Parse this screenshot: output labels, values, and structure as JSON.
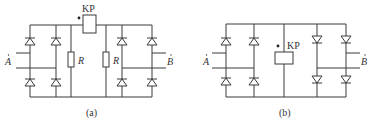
{
  "figures": [
    {
      "id": "a",
      "caption": "(a)",
      "relay_label": "KP",
      "resistor_labels": [
        "R",
        "R"
      ],
      "input_label": "A",
      "output_label": "B",
      "left_bridge_diode_direction": "up",
      "right_bridge_diode_direction": "up",
      "resistor_count": 2
    },
    {
      "id": "b",
      "caption": "(b)",
      "relay_label": "KP",
      "input_label": "A",
      "output_label": "B",
      "left_bridge_diode_direction": "up",
      "right_bridge_diode_direction": "down",
      "resistor_count": 0
    }
  ],
  "colors": {
    "line": "#3a3a3a",
    "text": "#333333",
    "background": "#ffffff"
  }
}
